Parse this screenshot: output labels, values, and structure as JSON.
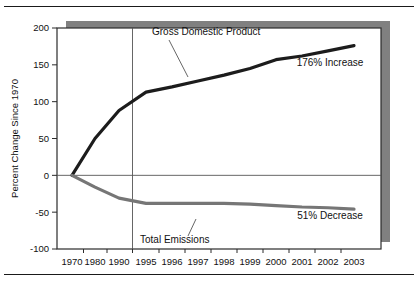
{
  "chart_data": {
    "type": "line",
    "title": "",
    "xlabel": "",
    "ylabel": "Percent Change Since 1970",
    "ylim": [
      -100,
      200
    ],
    "yticks": [
      200,
      150,
      100,
      50,
      0,
      -50,
      -100
    ],
    "ytick_labels": [
      "200",
      "150",
      "100",
      "50",
      "0",
      "-50",
      "-100"
    ],
    "x": [
      1970,
      1980,
      1990,
      1995,
      1996,
      1997,
      1998,
      1999,
      2000,
      2001,
      2002,
      2003
    ],
    "xtick_labels": [
      "1970",
      "1980",
      "1990",
      "1995",
      "1996",
      "1997",
      "1998",
      "1999",
      "2000",
      "2001",
      "2002",
      "2003"
    ],
    "grid": false,
    "zero_reference_line": true,
    "section_divider_after": "1990",
    "legend_position": "inline-annotations",
    "series": [
      {
        "name": "Gross Domestic Product",
        "color": "#1c1c1c",
        "values": [
          0,
          50,
          88,
          113,
          120,
          128,
          136,
          145,
          157,
          162,
          169,
          176
        ]
      },
      {
        "name": "Total Emissions",
        "color": "#767676",
        "values": [
          0,
          -16,
          -31,
          -38,
          -38,
          -38,
          -38,
          -39,
          -41,
          -43,
          -44,
          -46
        ]
      }
    ],
    "annotations": [
      {
        "text": "Gross Domestic Product",
        "series": "Gross Domestic Product"
      },
      {
        "text": "Total Emissions",
        "series": "Total Emissions"
      },
      {
        "text": "176% Increase",
        "series": "Gross Domestic Product"
      },
      {
        "text": "51% Decrease",
        "series": "Total Emissions"
      }
    ]
  },
  "colors": {
    "gdp_line": "#1c1c1c",
    "emissions_line": "#767676",
    "frame": "#2b2b2b",
    "shadow": "#808080",
    "zero_line": "#555555",
    "divider": "#555555",
    "text": "#111111"
  }
}
